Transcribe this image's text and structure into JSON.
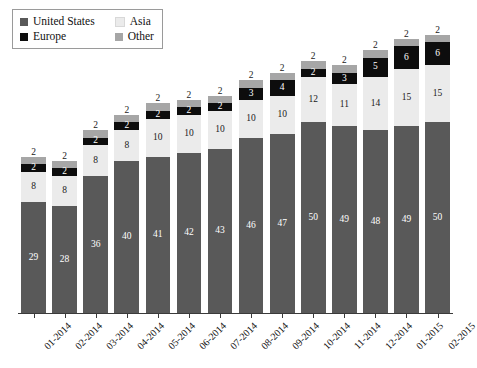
{
  "legend": {
    "items": [
      {
        "label": "United States",
        "color": "#595959",
        "swatch": "legend-swatch-united-states"
      },
      {
        "label": "Asia",
        "color": "#ebebeb",
        "swatch": "legend-swatch-asia"
      },
      {
        "label": "Europe",
        "color": "#0d0d0d",
        "swatch": "legend-swatch-europe"
      },
      {
        "label": "Other",
        "color": "#a6a6a6",
        "swatch": "legend-swatch-other"
      }
    ]
  },
  "chart_data": {
    "type": "bar",
    "subtype": "stacked-vertical",
    "title": "",
    "xlabel": "",
    "ylabel": "",
    "grid": false,
    "axis": {
      "y_visible": false,
      "x_visible": true,
      "ylim": [
        0,
        80
      ]
    },
    "legend_position": "top-left",
    "stack_order_bottom_to_top": [
      "United States",
      "Asia",
      "Europe",
      "Other"
    ],
    "categories": [
      "01-2014",
      "02-2014",
      "03-2014",
      "04-2014",
      "05-2014",
      "06-2014",
      "07-2014",
      "08-2014",
      "09-2014",
      "10-2014",
      "11-2014",
      "12-2014",
      "01-2015",
      "02-2015"
    ],
    "series": [
      {
        "name": "United States",
        "color": "#595959",
        "values": [
          29,
          28,
          36,
          40,
          41,
          42,
          43,
          46,
          47,
          50,
          49,
          48,
          49,
          50
        ]
      },
      {
        "name": "Asia",
        "color": "#ebebeb",
        "values": [
          8,
          8,
          8,
          8,
          10,
          10,
          10,
          10,
          10,
          12,
          11,
          14,
          15,
          15
        ]
      },
      {
        "name": "Europe",
        "color": "#0d0d0d",
        "values": [
          2,
          2,
          2,
          2,
          2,
          2,
          2,
          3,
          4,
          2,
          3,
          5,
          6,
          6
        ]
      },
      {
        "name": "Other",
        "color": "#a6a6a6",
        "values": [
          2,
          2,
          2,
          2,
          2,
          2,
          2,
          2,
          2,
          2,
          2,
          2,
          2,
          2
        ]
      }
    ],
    "totals": [
      41,
      40,
      48,
      52,
      55,
      56,
      57,
      61,
      63,
      66,
      65,
      69,
      72,
      73
    ]
  }
}
